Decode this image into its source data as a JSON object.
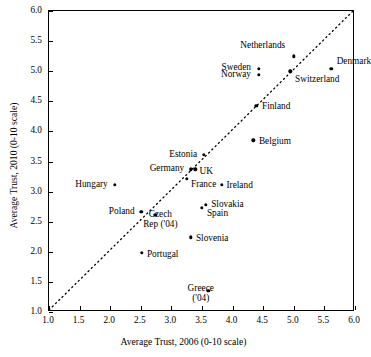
{
  "chart_data": {
    "type": "scatter",
    "title": "",
    "xlabel": "Average Trust, 2006 (0-10 scale)",
    "ylabel": "Average Trust, 2010 (0-10 scale)",
    "xlim": [
      1.0,
      6.0
    ],
    "ylim": [
      1.0,
      6.0
    ],
    "xticks": [
      "1.0",
      "1.5",
      "2.0",
      "2.5",
      "3.0",
      "3.5",
      "4.0",
      "4.5",
      "5.0",
      "5.5",
      "6.0"
    ],
    "yticks": [
      "1.0",
      "1.5",
      "2.0",
      "2.5",
      "3.0",
      "3.5",
      "4.0",
      "4.5",
      "5.0",
      "5.5",
      "6.0"
    ],
    "grid": false,
    "legend": "none",
    "reference_line": {
      "type": "45-degree dotted identity line",
      "from": [
        1.0,
        1.0
      ],
      "to": [
        6.0,
        6.0
      ],
      "style": "dotted"
    },
    "points": [
      {
        "label": "Netherlands",
        "x": 5.0,
        "y": 5.25,
        "lx": 4.86,
        "ly": 5.43,
        "anchor": "r"
      },
      {
        "label": "Denmark",
        "x": 5.61,
        "y": 5.04,
        "lx": 5.7,
        "ly": 5.17,
        "anchor": "l"
      },
      {
        "label": "Sweden",
        "x": 4.43,
        "y": 5.04,
        "lx": 4.3,
        "ly": 5.07,
        "anchor": "r"
      },
      {
        "label": "Norway",
        "x": 4.43,
        "y": 4.94,
        "lx": 4.3,
        "ly": 4.95,
        "anchor": "r"
      },
      {
        "label": "Switzerland",
        "x": 4.94,
        "y": 5.0,
        "lx": 5.02,
        "ly": 4.87,
        "anchor": "l"
      },
      {
        "label": "Finland",
        "x": 4.39,
        "y": 4.43,
        "lx": 4.48,
        "ly": 4.42,
        "anchor": "l"
      },
      {
        "label": "Belgium",
        "x": 4.34,
        "y": 3.85,
        "lx": 4.43,
        "ly": 3.84,
        "anchor": "l"
      },
      {
        "label": "Estonia",
        "x": 3.53,
        "y": 3.61,
        "lx": 3.42,
        "ly": 3.63,
        "anchor": "r"
      },
      {
        "label": "Germany",
        "x": 3.32,
        "y": 3.37,
        "lx": 3.21,
        "ly": 3.39,
        "anchor": "r"
      },
      {
        "label": "UK",
        "x": 3.39,
        "y": 3.37,
        "lx": 3.46,
        "ly": 3.35,
        "anchor": "l"
      },
      {
        "label": "France",
        "x": 3.25,
        "y": 3.21,
        "lx": 3.32,
        "ly": 3.12,
        "anchor": "l"
      },
      {
        "label": "Ireland",
        "x": 3.82,
        "y": 3.11,
        "lx": 3.9,
        "ly": 3.11,
        "anchor": "l"
      },
      {
        "label": "Hungary",
        "x": 2.08,
        "y": 3.11,
        "lx": 1.96,
        "ly": 3.13,
        "anchor": "r"
      },
      {
        "label": "Poland",
        "x": 2.51,
        "y": 2.66,
        "lx": 2.4,
        "ly": 2.67,
        "anchor": "r"
      },
      {
        "label": "Czech\nRep ('04)",
        "x": 2.74,
        "y": 2.61,
        "lx": 2.82,
        "ly": 2.54,
        "anchor": "l"
      },
      {
        "label": "Slovakia",
        "x": 3.56,
        "y": 2.78,
        "lx": 3.65,
        "ly": 2.79,
        "anchor": "l"
      },
      {
        "label": "Spain",
        "x": 3.5,
        "y": 2.73,
        "lx": 3.58,
        "ly": 2.64,
        "anchor": "l"
      },
      {
        "label": "Slovenia",
        "x": 3.32,
        "y": 2.24,
        "lx": 3.4,
        "ly": 2.23,
        "anchor": "l"
      },
      {
        "label": "Portugal",
        "x": 2.52,
        "y": 1.98,
        "lx": 2.6,
        "ly": 1.97,
        "anchor": "l"
      },
      {
        "label": "Greece\n('04)",
        "x": 3.6,
        "y": 1.35,
        "lx": 3.48,
        "ly": 1.31,
        "anchor": "r"
      }
    ]
  }
}
